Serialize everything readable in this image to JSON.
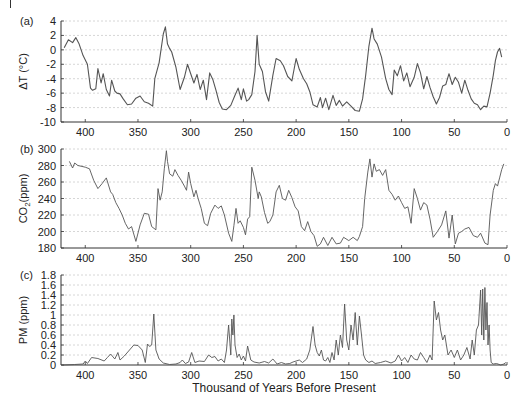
{
  "figure": {
    "xlabel": "Thousand of Years Before Present",
    "line_color": "#555555",
    "grid_color": "#cccccc"
  },
  "chart_data": [
    {
      "type": "line",
      "panel": "(a)",
      "title": "",
      "ylabel": "ΔT (°C)",
      "xlabel": "",
      "xlim": [
        423,
        0
      ],
      "ylim": [
        -10,
        4
      ],
      "yticks": [
        4,
        2,
        0,
        -2,
        -4,
        -6,
        -8,
        -10
      ],
      "xticks": [
        400,
        350,
        300,
        250,
        200,
        150,
        100,
        50,
        0
      ],
      "grid": true,
      "x": [
        420,
        416,
        412,
        409,
        406,
        402,
        398,
        395,
        393,
        390,
        388,
        385,
        383,
        380,
        377,
        375,
        372,
        370,
        367,
        364,
        360,
        356,
        352,
        348,
        344,
        340,
        336,
        334,
        330,
        326,
        324,
        322,
        320,
        318,
        314,
        310,
        306,
        303,
        300,
        297,
        294,
        291,
        288,
        285,
        282,
        279,
        276,
        273,
        270,
        266,
        262,
        258,
        255,
        252,
        250,
        247,
        245,
        242,
        239,
        237,
        235,
        232,
        229,
        226,
        222,
        219,
        215,
        212,
        208,
        204,
        200,
        197,
        193,
        190,
        187,
        184,
        180,
        177,
        175,
        172,
        169,
        165,
        162,
        159,
        156,
        152,
        148,
        144,
        140,
        137,
        134,
        131,
        128,
        126,
        123,
        119,
        115,
        112,
        109,
        107,
        104,
        101,
        98,
        95,
        92,
        88,
        85,
        82,
        79,
        76,
        73,
        70,
        67,
        64,
        61,
        58,
        55,
        52,
        49,
        46,
        43,
        40,
        37,
        34,
        31,
        28,
        25,
        22,
        19,
        16,
        13,
        11,
        9,
        7,
        5
      ],
      "values": [
        0.3,
        1.4,
        1.0,
        1.7,
        0.9,
        -0.8,
        -2.0,
        -5.3,
        -5.6,
        -5.4,
        -2.6,
        -4.6,
        -3.3,
        -5.5,
        -6.4,
        -4.2,
        -5.7,
        -6.0,
        -6.1,
        -6.8,
        -7.6,
        -7.5,
        -6.7,
        -6.4,
        -7.2,
        -7.4,
        -7.8,
        -4.0,
        -1.8,
        2.2,
        3.2,
        0.8,
        0.2,
        -0.3,
        -2.4,
        -5.5,
        -3.8,
        -2.0,
        -3.3,
        -4.6,
        -3.4,
        -5.5,
        -4.2,
        -6.9,
        -3.2,
        -4.1,
        -5.6,
        -7.3,
        -8.2,
        -8.3,
        -7.7,
        -6.3,
        -5.3,
        -6.9,
        -5.4,
        -7.1,
        -6.9,
        -6.2,
        -3.0,
        2.0,
        -2.0,
        -3.0,
        -5.8,
        -7.1,
        -3.5,
        -1.2,
        -1.5,
        -2.2,
        -3.7,
        -4.3,
        -1.2,
        -2.7,
        -4.0,
        -4.7,
        -5.8,
        -7.6,
        -7.9,
        -6.6,
        -8.0,
        -6.7,
        -8.3,
        -6.3,
        -7.7,
        -7.0,
        -7.8,
        -7.2,
        -7.8,
        -8.4,
        -8.5,
        -6.8,
        -3.5,
        0.5,
        3.0,
        1.5,
        0.8,
        -1.0,
        -4.0,
        -5.5,
        -6.2,
        -2.8,
        -3.6,
        -2.2,
        -4.3,
        -3.2,
        -5.1,
        -3.8,
        -1.9,
        -3.2,
        -5.4,
        -3.7,
        -5.2,
        -6.5,
        -7.5,
        -6.6,
        -5.0,
        -4.8,
        -3.3,
        -4.8,
        -3.8,
        -4.5,
        -6.0,
        -4.2,
        -5.6,
        -6.8,
        -7.4,
        -7.6,
        -8.3,
        -7.8,
        -7.9,
        -6.0,
        -3.5,
        -1.5,
        -0.3,
        0.2,
        -1.0
      ]
    },
    {
      "type": "line",
      "panel": "(b)",
      "title": "",
      "ylabel": "CO2(ppm)",
      "xlabel": "",
      "xlim": [
        423,
        0
      ],
      "ylim": [
        180,
        300
      ],
      "yticks": [
        300,
        280,
        260,
        240,
        220,
        200,
        180
      ],
      "xticks": [
        400,
        350,
        300,
        250,
        200,
        150,
        100,
        50,
        0
      ],
      "grid": true,
      "x": [
        415,
        412,
        410,
        407,
        400,
        396,
        392,
        388,
        384,
        380,
        376,
        374,
        371,
        368,
        365,
        362,
        359,
        356,
        352,
        348,
        344,
        340,
        337,
        333,
        331,
        329,
        327,
        325,
        323,
        322,
        320,
        317,
        315,
        312,
        309,
        306,
        304,
        302,
        300,
        297,
        295,
        293,
        290,
        287,
        284,
        281,
        277,
        274,
        271,
        268,
        264,
        261,
        259,
        257,
        255,
        253,
        250,
        248,
        246,
        244,
        242,
        239,
        236,
        235,
        233,
        230,
        227,
        225,
        222,
        219,
        216,
        213,
        210,
        207,
        204,
        201,
        198,
        195,
        192,
        189,
        186,
        183,
        180,
        177,
        174,
        170,
        166,
        162,
        158,
        155,
        150,
        146,
        142,
        140,
        137,
        135,
        132,
        130,
        128,
        126,
        124,
        121,
        118,
        115,
        112,
        109,
        106,
        103,
        100,
        97,
        94,
        91,
        88,
        85,
        82,
        79,
        76,
        73,
        70,
        66,
        62,
        58,
        55,
        52,
        49,
        46,
        43,
        40,
        36,
        32,
        28,
        25,
        21,
        18,
        16,
        13,
        11,
        9,
        7,
        5,
        3
      ],
      "values": [
        285,
        277,
        283,
        280,
        278,
        276,
        262,
        252,
        258,
        265,
        248,
        245,
        235,
        228,
        220,
        210,
        203,
        206,
        188,
        208,
        222,
        221,
        206,
        202,
        252,
        238,
        248,
        276,
        298,
        285,
        270,
        267,
        275,
        268,
        262,
        255,
        250,
        272,
        258,
        242,
        250,
        240,
        228,
        210,
        207,
        222,
        232,
        228,
        231,
        220,
        198,
        188,
        207,
        228,
        210,
        213,
        205,
        196,
        215,
        218,
        278,
        262,
        240,
        248,
        242,
        223,
        210,
        212,
        220,
        248,
        256,
        240,
        238,
        250,
        241,
        230,
        225,
        206,
        201,
        212,
        200,
        195,
        182,
        185,
        193,
        183,
        193,
        185,
        186,
        193,
        189,
        193,
        189,
        194,
        206,
        240,
        272,
        288,
        266,
        282,
        273,
        275,
        268,
        275,
        250,
        245,
        238,
        243,
        235,
        228,
        230,
        210,
        252,
        240,
        226,
        235,
        232,
        215,
        193,
        200,
        208,
        225,
        192,
        220,
        185,
        198,
        200,
        203,
        205,
        195,
        193,
        198,
        186,
        184,
        220,
        250,
        258,
        255,
        265,
        275,
        282
      ]
    },
    {
      "type": "line",
      "panel": "(c)",
      "title": "",
      "ylabel": "PM (ppm)",
      "xlabel": "Thousand of Years Before Present",
      "xlim": [
        423,
        0
      ],
      "ylim": [
        0,
        1.8
      ],
      "yticks": [
        1.8,
        1.6,
        1.4,
        1.2,
        1,
        0.8,
        0.6,
        0.4,
        0.2,
        0
      ],
      "xticks": [
        400,
        350,
        300,
        250,
        200,
        150,
        100,
        50,
        0
      ],
      "grid": true,
      "x": [
        422,
        410,
        402,
        400,
        398,
        394,
        388,
        382,
        379,
        376,
        372,
        369,
        367,
        363,
        358,
        354,
        350,
        346,
        343,
        341,
        339,
        337,
        335,
        333,
        330,
        326,
        320,
        314,
        310,
        308,
        305,
        302,
        299,
        296,
        292,
        287,
        283,
        280,
        277,
        274,
        271,
        268,
        266,
        264,
        263,
        262,
        261,
        260,
        259,
        258,
        256,
        254,
        252,
        250,
        248,
        246,
        243,
        240,
        235,
        230,
        226,
        222,
        218,
        214,
        210,
        206,
        203,
        200,
        197,
        194,
        190,
        187,
        184,
        182,
        180,
        178,
        176,
        174,
        172,
        170,
        168,
        166,
        164,
        162,
        160,
        158,
        156,
        154,
        152,
        150,
        148,
        146,
        144,
        142,
        140,
        138,
        136,
        134,
        131,
        128,
        125,
        120,
        115,
        110,
        106,
        103,
        100,
        97,
        94,
        91,
        88,
        85,
        82,
        79,
        76,
        73,
        71,
        69,
        67,
        65,
        63,
        61,
        59,
        56,
        53,
        50,
        47,
        44,
        41,
        38,
        35,
        33,
        31,
        29,
        27,
        25,
        24,
        23,
        22,
        21,
        20,
        19,
        18,
        17,
        16,
        15,
        13,
        10,
        6,
        3,
        1
      ],
      "values": [
        0.0,
        0.01,
        0.02,
        0.08,
        0.03,
        0.15,
        0.13,
        0.08,
        0.15,
        0.22,
        0.12,
        0.25,
        0.1,
        0.18,
        0.3,
        0.4,
        0.39,
        0.3,
        0.05,
        0.42,
        0.37,
        0.4,
        1.02,
        0.3,
        0.12,
        0.04,
        0.01,
        0.02,
        0.05,
        0.1,
        0.03,
        0.06,
        0.25,
        0.05,
        0.08,
        0.07,
        0.2,
        0.15,
        0.17,
        0.08,
        0.12,
        0.05,
        0.3,
        0.8,
        0.5,
        0.2,
        0.92,
        0.6,
        1.0,
        0.4,
        0.15,
        0.22,
        0.1,
        0.18,
        0.08,
        0.38,
        0.1,
        0.06,
        0.04,
        0.07,
        0.04,
        0.12,
        0.02,
        0.05,
        0.02,
        0.03,
        0.06,
        0.08,
        0.1,
        0.05,
        0.12,
        0.3,
        0.77,
        0.4,
        0.25,
        0.18,
        0.3,
        0.1,
        0.08,
        0.15,
        0.05,
        0.25,
        0.1,
        0.5,
        0.2,
        0.6,
        0.35,
        1.22,
        0.5,
        0.3,
        0.8,
        0.5,
        1.05,
        0.4,
        0.98,
        0.6,
        0.2,
        0.1,
        0.05,
        0.08,
        0.03,
        0.05,
        0.08,
        0.04,
        0.08,
        0.2,
        0.08,
        0.15,
        0.05,
        0.2,
        0.12,
        0.1,
        0.25,
        0.15,
        0.05,
        0.2,
        0.1,
        1.28,
        0.9,
        1.05,
        0.7,
        0.5,
        0.6,
        0.2,
        0.3,
        0.15,
        0.3,
        0.1,
        0.2,
        0.35,
        0.12,
        0.5,
        0.2,
        0.7,
        0.8,
        1.5,
        0.6,
        1.52,
        0.5,
        1.55,
        0.7,
        1.25,
        0.4,
        0.8,
        0.3,
        0.05,
        0.02,
        0.03,
        0.0,
        0.02,
        0.05
      ]
    }
  ]
}
